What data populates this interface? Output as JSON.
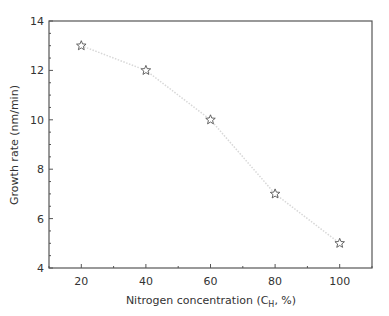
{
  "chart_data": {
    "type": "line",
    "title": "",
    "xlabel": "Nitrogen concentration (C_H, %)",
    "xlabel_main": "Nitrogen concentration (C",
    "xlabel_sub": "H",
    "xlabel_tail": ", %)",
    "ylabel": "Growth rate (nm/min)",
    "x": [
      20,
      40,
      60,
      80,
      100
    ],
    "series": [
      {
        "name": "Growth rate",
        "values": [
          13,
          12,
          10,
          7,
          5
        ],
        "marker": "star",
        "line_style": "dotted",
        "line_color": "#d8d8d8",
        "marker_color": "#555555"
      }
    ],
    "xlim": [
      10,
      110
    ],
    "ylim": [
      4,
      14
    ],
    "xticks": [
      20,
      40,
      60,
      80,
      100
    ],
    "yticks": [
      4,
      6,
      8,
      10,
      12,
      14
    ],
    "grid": false,
    "legend": null
  }
}
